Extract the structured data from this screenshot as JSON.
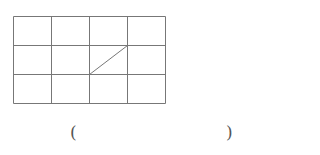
{
  "figure": {
    "type": "grid-with-diagonal",
    "rows": 3,
    "cols": 4,
    "origin": [
      13,
      16
    ],
    "cell_width": 38,
    "cell_height": 29,
    "line_color": "#777777",
    "diagonal": {
      "from": {
        "row_line": 2,
        "col_line": 2
      },
      "to": {
        "row_line": 1,
        "col_line": 3
      }
    }
  },
  "answer": {
    "left_paren": "(",
    "right_paren": ")",
    "value": ""
  }
}
